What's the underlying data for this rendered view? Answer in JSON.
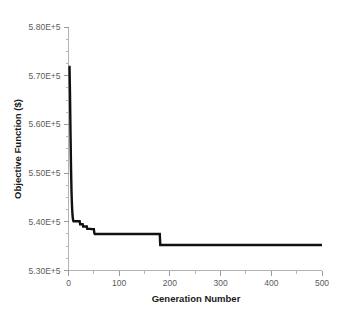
{
  "chart_data": {
    "type": "line",
    "title": "",
    "xlabel": "Generation Number",
    "ylabel": "Objective Function ($)",
    "xlim": [
      0,
      500
    ],
    "ylim": [
      530000,
      580000
    ],
    "grid": false,
    "legend": null,
    "x_ticks": [
      0,
      100,
      200,
      300,
      400,
      500
    ],
    "x_tick_labels": [
      "0",
      "100",
      "200",
      "300",
      "400",
      "500"
    ],
    "x_minor_ticks": [
      50,
      150,
      250,
      350,
      450
    ],
    "y_ticks": [
      530000,
      540000,
      550000,
      560000,
      570000,
      580000
    ],
    "y_tick_labels": [
      "5.30E+5",
      "5.40E+5",
      "5.50E+5",
      "5.60E+5",
      "5.70E+5",
      "5.80E+5"
    ],
    "y_minor_ticks": [
      532500,
      535000,
      537500,
      542500,
      545000,
      547500,
      552500,
      555000,
      557500,
      562500,
      565000,
      567500,
      572500,
      575000,
      577500
    ],
    "series": [
      {
        "name": "Best objective value",
        "color": "#111111",
        "line_width": 2.4,
        "x": [
          0,
          2,
          3,
          4,
          5,
          6,
          7,
          8,
          9,
          10,
          12,
          16,
          20,
          22,
          23,
          28,
          29,
          36,
          37,
          44,
          45,
          50,
          51,
          52,
          180,
          181,
          500
        ],
        "y": [
          571800,
          571800,
          566000,
          558000,
          551000,
          546000,
          543000,
          541200,
          540400,
          540100,
          540100,
          540100,
          540100,
          540100,
          539500,
          539500,
          539050,
          539050,
          538550,
          538550,
          538500,
          538500,
          537650,
          537500,
          537500,
          535250,
          535250
        ]
      }
    ]
  },
  "axes": {
    "y_axis_title": "Objective Function ($)",
    "x_axis_title": "Generation Number"
  }
}
